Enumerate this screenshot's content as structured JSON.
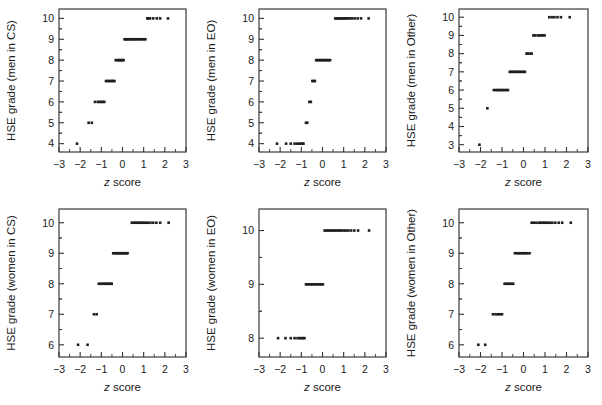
{
  "figure": {
    "background": "#ffffff",
    "point_color": "#1f1f1f",
    "axis_color": "#333333",
    "x_axis_label_italic": "z",
    "x_axis_label_rest": " score",
    "panel_count": 6,
    "layout": "2 rows x 3 columns"
  },
  "chart_data": [
    {
      "type": "scatter",
      "panel_id": "men-cs",
      "title": "",
      "xlabel": "z score",
      "ylabel": "HSE grade (men in CS)",
      "xlim": [
        -3,
        3
      ],
      "ylim": [
        3.6,
        10.45
      ],
      "xticks": [
        -3,
        -2,
        -1,
        0,
        1,
        2,
        3
      ],
      "xticklabels": [
        "-3",
        "-2",
        "-1",
        "0",
        "1",
        "2",
        "3"
      ],
      "yticks": [
        4,
        5,
        6,
        7,
        8,
        9,
        10
      ],
      "yticklabels": [
        "4",
        "5",
        "6",
        "7",
        "8",
        "9",
        "10"
      ],
      "grid": false,
      "legend": false,
      "x": [
        -2.15,
        -1.6,
        -1.45,
        -1.3,
        -1.17,
        -1.08,
        -1.0,
        -0.93,
        -0.86,
        -0.78,
        -0.71,
        -0.64,
        -0.57,
        -0.5,
        -0.44,
        -0.38,
        -0.32,
        -0.26,
        -0.2,
        -0.15,
        -0.1,
        -0.05,
        0.0,
        0.05,
        0.1,
        0.15,
        0.2,
        0.26,
        0.32,
        0.38,
        0.44,
        0.5,
        0.57,
        0.64,
        0.71,
        0.78,
        0.86,
        0.93,
        1.0,
        1.08,
        1.17,
        1.22,
        1.3,
        1.45,
        1.62,
        1.78,
        2.15
      ],
      "y": [
        4,
        5,
        5,
        6,
        6,
        6,
        6,
        6,
        6,
        7,
        7,
        7,
        7,
        7,
        7,
        7,
        8,
        8,
        8,
        8,
        8,
        8,
        8,
        8,
        9,
        9,
        9,
        9,
        9,
        9,
        9,
        9,
        9,
        9,
        9,
        9,
        9,
        9,
        9,
        9,
        10,
        10,
        10,
        10,
        10,
        10,
        10
      ]
    },
    {
      "type": "scatter",
      "panel_id": "men-eo",
      "title": "",
      "xlabel": "z score",
      "ylabel": "HSE grade (men in EO)",
      "xlim": [
        -3,
        3
      ],
      "ylim": [
        3.6,
        10.45
      ],
      "xticks": [
        -3,
        -2,
        -1,
        0,
        1,
        2,
        3
      ],
      "xticklabels": [
        "-3",
        "-2",
        "-1",
        "0",
        "1",
        "2",
        "3"
      ],
      "yticks": [
        4,
        5,
        6,
        7,
        8,
        9,
        10
      ],
      "yticklabels": [
        "4",
        "5",
        "6",
        "7",
        "8",
        "9",
        "10"
      ],
      "grid": false,
      "legend": false,
      "x": [
        -2.15,
        -1.72,
        -1.5,
        -1.32,
        -1.2,
        -1.1,
        -1.02,
        -0.95,
        -0.9,
        -0.78,
        -0.72,
        -0.62,
        -0.55,
        -0.48,
        -0.42,
        -0.36,
        -0.3,
        -0.24,
        -0.18,
        -0.12,
        -0.06,
        0.0,
        0.06,
        0.12,
        0.18,
        0.24,
        0.3,
        0.36,
        0.6,
        0.66,
        0.72,
        0.78,
        0.84,
        0.9,
        0.96,
        1.02,
        1.08,
        1.15,
        1.22,
        1.3,
        1.4,
        1.52,
        1.66,
        1.82,
        2.18
      ],
      "y": [
        4,
        4,
        4,
        4,
        4,
        4,
        4,
        4,
        4,
        5,
        5,
        6,
        6,
        7,
        7,
        7,
        8,
        8,
        8,
        8,
        8,
        8,
        8,
        8,
        8,
        8,
        8,
        8,
        10,
        10,
        10,
        10,
        10,
        10,
        10,
        10,
        10,
        10,
        10,
        10,
        10,
        10,
        10,
        10,
        10
      ]
    },
    {
      "type": "scatter",
      "panel_id": "men-other",
      "title": "",
      "xlabel": "z score",
      "ylabel": "HSE grade (men in Other)",
      "xlim": [
        -3,
        3
      ],
      "ylim": [
        2.6,
        10.45
      ],
      "xticks": [
        -3,
        -2,
        -1,
        0,
        1,
        2,
        3
      ],
      "xticklabels": [
        "-3",
        "-2",
        "-1",
        "0",
        "1",
        "2",
        "3"
      ],
      "yticks": [
        3,
        4,
        5,
        6,
        7,
        8,
        9,
        10
      ],
      "yticklabels": [
        "3",
        "4",
        "5",
        "6",
        "7",
        "8",
        "9",
        "10"
      ],
      "grid": false,
      "legend": false,
      "x": [
        -2.05,
        -1.68,
        -1.38,
        -1.28,
        -1.2,
        -1.12,
        -1.04,
        -0.96,
        -0.88,
        -0.8,
        -0.72,
        -0.64,
        -0.56,
        -0.5,
        -0.42,
        -0.35,
        -0.28,
        -0.21,
        -0.14,
        -0.07,
        0.0,
        0.07,
        0.14,
        0.21,
        0.3,
        0.38,
        0.46,
        0.54,
        0.66,
        0.74,
        0.82,
        0.9,
        0.98,
        1.2,
        1.32,
        1.44,
        1.58,
        1.74,
        2.15
      ],
      "y": [
        3,
        5,
        6,
        6,
        6,
        6,
        6,
        6,
        6,
        6,
        6,
        7,
        7,
        7,
        7,
        7,
        7,
        7,
        7,
        7,
        7,
        7,
        8,
        8,
        8,
        8,
        9,
        9,
        9,
        9,
        9,
        9,
        9,
        10,
        10,
        10,
        10,
        10,
        10
      ]
    },
    {
      "type": "scatter",
      "panel_id": "women-cs",
      "title": "",
      "xlabel": "z score",
      "ylabel": "HSE grade (women in CS)",
      "xlim": [
        -3,
        3
      ],
      "ylim": [
        5.6,
        10.45
      ],
      "xticks": [
        -3,
        -2,
        -1,
        0,
        1,
        2,
        3
      ],
      "xticklabels": [
        "-3",
        "-2",
        "-1",
        "0",
        "1",
        "2",
        "3"
      ],
      "yticks": [
        6,
        7,
        8,
        9,
        10
      ],
      "yticklabels": [
        "6",
        "7",
        "8",
        "9",
        "10"
      ],
      "grid": false,
      "legend": false,
      "x": [
        -2.1,
        -1.65,
        -1.35,
        -1.22,
        -1.12,
        -1.03,
        -0.95,
        -0.87,
        -0.8,
        -0.72,
        -0.65,
        -0.58,
        -0.51,
        -0.44,
        -0.37,
        -0.3,
        -0.24,
        -0.18,
        -0.12,
        -0.06,
        0.0,
        0.06,
        0.12,
        0.18,
        0.24,
        0.44,
        0.52,
        0.6,
        0.68,
        0.76,
        0.84,
        0.92,
        1.0,
        1.1,
        1.2,
        1.32,
        1.45,
        1.6,
        1.78,
        2.18
      ],
      "y": [
        6,
        6,
        7,
        7,
        8,
        8,
        8,
        8,
        8,
        8,
        8,
        8,
        8,
        9,
        9,
        9,
        9,
        9,
        9,
        9,
        9,
        9,
        9,
        9,
        9,
        10,
        10,
        10,
        10,
        10,
        10,
        10,
        10,
        10,
        10,
        10,
        10,
        10,
        10,
        10
      ]
    },
    {
      "type": "scatter",
      "panel_id": "women-eo",
      "title": "",
      "xlabel": "z score",
      "ylabel": "HSE grade (women in EO)",
      "xlim": [
        -3,
        3
      ],
      "ylim": [
        7.65,
        10.4
      ],
      "xticks": [
        -3,
        -2,
        -1,
        0,
        1,
        2,
        3
      ],
      "xticklabels": [
        "-3",
        "-2",
        "-1",
        "0",
        "1",
        "2",
        "3"
      ],
      "yticks": [
        8,
        9,
        10
      ],
      "yticklabels": [
        "8",
        "9",
        "10"
      ],
      "grid": false,
      "legend": false,
      "x": [
        -2.1,
        -1.75,
        -1.5,
        -1.32,
        -1.18,
        -1.08,
        -1.0,
        -0.92,
        -0.85,
        -0.78,
        -0.7,
        -0.62,
        -0.54,
        -0.46,
        -0.38,
        -0.3,
        -0.22,
        -0.14,
        -0.06,
        0.02,
        0.1,
        0.18,
        0.26,
        0.34,
        0.42,
        0.5,
        0.58,
        0.66,
        0.74,
        0.82,
        0.9,
        1.0,
        1.1,
        1.22,
        1.35,
        1.5,
        1.68,
        2.2
      ],
      "y": [
        8,
        8,
        8,
        8,
        8,
        8,
        8,
        8,
        8,
        9,
        9,
        9,
        9,
        9,
        9,
        9,
        9,
        9,
        9,
        9,
        10,
        10,
        10,
        10,
        10,
        10,
        10,
        10,
        10,
        10,
        10,
        10,
        10,
        10,
        10,
        10,
        10,
        10
      ]
    },
    {
      "type": "scatter",
      "panel_id": "women-other",
      "title": "",
      "xlabel": "z score",
      "ylabel": "HSE grade (women in Other)",
      "xlim": [
        -3,
        3
      ],
      "ylim": [
        5.6,
        10.45
      ],
      "xticks": [
        -3,
        -2,
        -1,
        0,
        1,
        2,
        3
      ],
      "xticklabels": [
        "-3",
        "-2",
        "-1",
        "0",
        "1",
        "2",
        "3"
      ],
      "yticks": [
        6,
        7,
        8,
        9,
        10
      ],
      "yticklabels": [
        "6",
        "7",
        "8",
        "9",
        "10"
      ],
      "grid": false,
      "legend": false,
      "x": [
        -2.1,
        -1.78,
        -1.42,
        -1.3,
        -1.2,
        -1.1,
        -1.0,
        -0.88,
        -0.8,
        -0.72,
        -0.64,
        -0.56,
        -0.48,
        -0.4,
        -0.3,
        -0.22,
        -0.14,
        -0.06,
        0.02,
        0.1,
        0.18,
        0.28,
        0.38,
        0.48,
        0.6,
        0.72,
        0.8,
        0.88,
        0.96,
        1.04,
        1.12,
        1.22,
        1.34,
        1.48,
        1.64,
        1.8,
        2.2
      ],
      "y": [
        6,
        6,
        7,
        7,
        7,
        7,
        7,
        8,
        8,
        8,
        8,
        8,
        8,
        9,
        9,
        9,
        9,
        9,
        9,
        9,
        9,
        9,
        10,
        10,
        10,
        10,
        10,
        10,
        10,
        10,
        10,
        10,
        10,
        10,
        10,
        10,
        10
      ]
    }
  ]
}
